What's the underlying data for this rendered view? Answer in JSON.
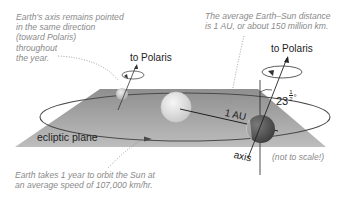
{
  "diagram": {
    "notes": {
      "axis_note": "Earth's axis remains pointed\nin the same direction\n(toward Polaris)\nthroughout\nthe year.",
      "distance_note": "The average Earth–Sun distance\nis 1 AU, or about 150 million km.",
      "orbit_note": "Earth takes 1 year to orbit the Sun at\nan average speed of 107,000 km/hr.",
      "scale_note": "(not to scale!)"
    },
    "labels": {
      "polaris_left": "to Polaris",
      "polaris_right": "to Polaris",
      "distance": "1 AU",
      "tilt_number": "23",
      "tilt_fraction_num": "1",
      "tilt_fraction_den": "2",
      "tilt_degree": "°",
      "plane": "ecliptic plane",
      "axis": "axis"
    },
    "colors": {
      "plane": "#a9a9a9",
      "orbit": "#4a4a4a",
      "sun": "#e2e2e2",
      "earth_far": "#c8c8c8",
      "earth_near": "#555555",
      "note_text": "#8a8a8a"
    }
  }
}
